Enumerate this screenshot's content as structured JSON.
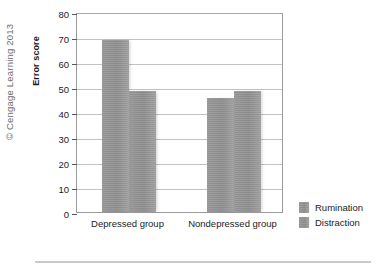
{
  "figure": {
    "copyright": "© Cengage Learning 2013"
  },
  "legend": {
    "items": [
      {
        "label": "Rumination",
        "color": "#8c8c8c"
      },
      {
        "label": "Distraction",
        "color": "#8c8c8c"
      }
    ]
  },
  "chart_data": {
    "type": "bar",
    "title": "",
    "xlabel": "",
    "ylabel": "Error score",
    "categories": [
      "Depressed group",
      "Nondepressed group"
    ],
    "series": [
      {
        "name": "Rumination",
        "values": [
          69,
          45.5
        ],
        "color": "#8c8c8c"
      },
      {
        "name": "Distraction",
        "values": [
          48.5,
          48.5
        ],
        "color": "#8c8c8c"
      }
    ],
    "ylim": [
      0,
      80
    ],
    "yticks": [
      0,
      10,
      20,
      30,
      40,
      50,
      60,
      70,
      80
    ],
    "ytick_labels": [
      "0",
      "10",
      "20",
      "30",
      "40",
      "50",
      "60",
      "70",
      "80"
    ],
    "grid": true,
    "legend_position": "right"
  }
}
